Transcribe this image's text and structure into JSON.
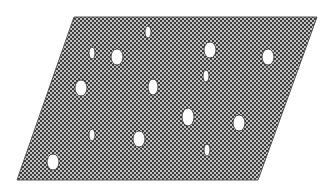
{
  "figure": {
    "width": 334,
    "height": 196,
    "background": "#ffffff",
    "plate": {
      "shape": "parallelogram",
      "points": [
        [
          74,
          17
        ],
        [
          317,
          17
        ],
        [
          258,
          180
        ],
        [
          17,
          180
        ]
      ],
      "pattern": {
        "type": "checker",
        "cell": 2,
        "color_a": "#3c3c3c",
        "color_b": "#c4c4c4"
      },
      "edge_color": "#555555"
    },
    "holes": [
      {
        "cx": 148,
        "cy": 32,
        "rx": 3,
        "ry": 6,
        "size": "small"
      },
      {
        "cx": 92,
        "cy": 53,
        "rx": 3,
        "ry": 6,
        "size": "small"
      },
      {
        "cx": 117,
        "cy": 57,
        "rx": 6,
        "ry": 8,
        "size": "large"
      },
      {
        "cx": 210,
        "cy": 50,
        "rx": 6,
        "ry": 8,
        "size": "large"
      },
      {
        "cx": 206,
        "cy": 76,
        "rx": 3,
        "ry": 6,
        "size": "small"
      },
      {
        "cx": 268,
        "cy": 57,
        "rx": 6,
        "ry": 8,
        "size": "large"
      },
      {
        "cx": 81,
        "cy": 88,
        "rx": 6,
        "ry": 8,
        "size": "large"
      },
      {
        "cx": 153,
        "cy": 87,
        "rx": 5,
        "ry": 8,
        "size": "large"
      },
      {
        "cx": 188,
        "cy": 117,
        "rx": 6,
        "ry": 9,
        "size": "large"
      },
      {
        "cx": 239,
        "cy": 123,
        "rx": 6,
        "ry": 8,
        "size": "large"
      },
      {
        "cx": 139,
        "cy": 139,
        "rx": 6,
        "ry": 8,
        "size": "large"
      },
      {
        "cx": 92,
        "cy": 135,
        "rx": 3,
        "ry": 6,
        "size": "small"
      },
      {
        "cx": 207,
        "cy": 150,
        "rx": 3,
        "ry": 6,
        "size": "small"
      },
      {
        "cx": 53,
        "cy": 162,
        "rx": 6,
        "ry": 8,
        "size": "large"
      }
    ],
    "hole_fill": "#ffffff",
    "hole_stroke": "#2a2a2a",
    "guide_lines": [
      {
        "x1": 90,
        "y1": 42,
        "x2": 135,
        "y2": 42
      },
      {
        "x1": 90,
        "y1": 72,
        "x2": 135,
        "y2": 72
      },
      {
        "x1": 225,
        "y1": 45,
        "x2": 280,
        "y2": 45
      },
      {
        "x1": 225,
        "y1": 68,
        "x2": 280,
        "y2": 68
      },
      {
        "x1": 60,
        "y1": 150,
        "x2": 170,
        "y2": 150
      },
      {
        "x1": 60,
        "y1": 175,
        "x2": 170,
        "y2": 175
      }
    ],
    "guide_color": "#9a9a9a"
  }
}
